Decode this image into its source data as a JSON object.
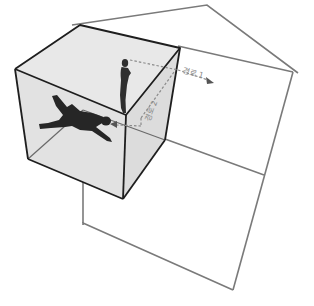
{
  "diagram": {
    "labels": {
      "path1": "경로 1",
      "path2": "경로 2"
    },
    "figures": [
      {
        "name": "standing-person",
        "pose": "standing"
      },
      {
        "name": "lying-person",
        "pose": "lying"
      }
    ],
    "colors": {
      "cube_edge": "#1e1e1e",
      "cube_fill": "#e4e4e4",
      "house_line": "#7a7a7a",
      "dashed_path": "#8a8a8a",
      "figure": "#2a2a2a",
      "background": "#ffffff"
    }
  }
}
